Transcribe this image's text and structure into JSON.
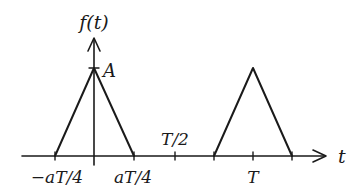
{
  "diagram": {
    "type": "periodic-triangular-pulse-plot",
    "y_axis_label": "f(t)",
    "x_axis_label": "t",
    "peak_label": "A",
    "tick_labels": {
      "neg_aT4": "−aT/4",
      "pos_aT4": "aT/4",
      "half_T": "T/2",
      "T": "T"
    },
    "pulses": [
      {
        "center": "0",
        "half_width": "aT/4",
        "height": "A"
      },
      {
        "center": "T",
        "half_width": "aT/4",
        "height": "A"
      }
    ],
    "colors": {
      "line": "#1a1a1a",
      "background": "#ffffff"
    }
  }
}
